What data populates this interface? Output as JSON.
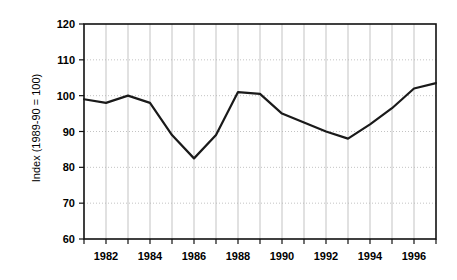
{
  "chart_data": {
    "type": "line",
    "title": "",
    "xlabel": "",
    "ylabel": "Index (1989-90 = 100)",
    "xlim": [
      1981,
      1997
    ],
    "ylim": [
      60,
      120
    ],
    "ytick_labels": [
      "60",
      "70",
      "80",
      "90",
      "100",
      "110",
      "120"
    ],
    "ytick_values": [
      60,
      70,
      80,
      90,
      100,
      110,
      120
    ],
    "xtick_labels": [
      "1982",
      "1984",
      "1986",
      "1988",
      "1990",
      "1992",
      "1994",
      "1996"
    ],
    "xtick_values": [
      1982,
      1984,
      1986,
      1988,
      1990,
      1992,
      1994,
      1996
    ],
    "xminor_values": [
      1981,
      1983,
      1985,
      1987,
      1989,
      1991,
      1993,
      1995,
      1997
    ],
    "grid": true,
    "grid_color": "#b4b4b4",
    "line_color": "#1a1a1a",
    "line_width": 2.2,
    "legend": false,
    "x": [
      1981,
      1982,
      1983,
      1984,
      1985,
      1986,
      1987,
      1988,
      1989,
      1990,
      1991,
      1992,
      1993,
      1994,
      1995,
      1996,
      1997
    ],
    "values": [
      99.0,
      98.0,
      100.0,
      98.0,
      89.0,
      82.5,
      89.0,
      101.0,
      100.5,
      95.0,
      92.5,
      90.0,
      88.0,
      92.0,
      96.5,
      102.0,
      103.5
    ],
    "series": [
      {
        "name": "Index (1989-90 = 100)",
        "values": [
          99.0,
          98.0,
          100.0,
          98.0,
          89.0,
          82.5,
          89.0,
          101.0,
          100.5,
          95.0,
          92.5,
          90.0,
          88.0,
          92.0,
          96.5,
          102.0,
          103.5
        ]
      }
    ]
  }
}
